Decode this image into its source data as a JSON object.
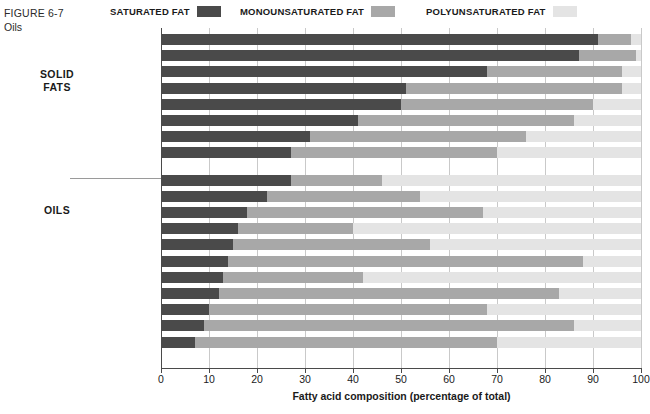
{
  "figure": {
    "number": "FIGURE 6-7",
    "title": "Oils"
  },
  "legend": {
    "position": "top",
    "items": [
      {
        "label": "SATURATED FAT",
        "key": "saturated",
        "color": "#4a4a4a"
      },
      {
        "label": "MONOUNSATURATED FAT",
        "key": "monounsaturated",
        "color": "#a8a8a8"
      },
      {
        "label": "POLYUNSATURATED FAT",
        "key": "polyunsaturated",
        "color": "#e4e4e4"
      }
    ]
  },
  "groups": [
    {
      "label": "SOLID\nFATS",
      "line1": "SOLID",
      "line2": "FATS"
    },
    {
      "label": "OILS",
      "line1": "OILS",
      "line2": ""
    }
  ],
  "axis": {
    "title": "Fatty acid composition (percentage of total)",
    "ticks": [
      0,
      10,
      20,
      30,
      40,
      50,
      60,
      70,
      80,
      90,
      100
    ],
    "min": 0,
    "max": 100
  },
  "footnotes": {
    "single_star": "*",
    "double_star": "**"
  },
  "chart_data": {
    "type": "bar",
    "orientation": "horizontal",
    "stacked": true,
    "title": "Oils",
    "subtitle": "FIGURE 6-7",
    "xlabel": "Fatty acid composition (percentage of total)",
    "ylabel": "",
    "xlim": [
      0,
      100
    ],
    "grid": true,
    "legend_position": "top",
    "series": [
      {
        "name": "SATURATED FAT",
        "color": "#4a4a4a",
        "values": [
          91,
          87,
          68,
          51,
          50,
          41,
          31,
          27,
          27,
          22,
          18,
          16,
          15,
          14,
          13,
          12,
          10,
          9,
          7
        ]
      },
      {
        "name": "MONOUNSATURATED FAT",
        "color": "#a8a8a8",
        "values": [
          7,
          12,
          28,
          45,
          40,
          45,
          45,
          43,
          19,
          32,
          49,
          24,
          41,
          74,
          29,
          71,
          58,
          77,
          63
        ]
      },
      {
        "name": "POLYUNSATURATED FAT",
        "color": "#e4e4e4",
        "values": [
          2,
          1,
          4,
          4,
          10,
          14,
          24,
          30,
          54,
          46,
          33,
          60,
          44,
          12,
          58,
          17,
          32,
          14,
          30
        ]
      }
    ],
    "categories": [
      "Coconut oil*",
      "Palm kernel oil*",
      "Butter",
      "Beef fat (tallow)",
      "Palm oil*",
      "Pork fat (lard)",
      "Chicken fat",
      "Shortening**",
      "Cottonseed oil",
      "Salmon oil",
      "Peanut oil",
      "Soybean oil",
      "Sesame oil",
      "Olive oil",
      "Corn oil",
      "Avocado oil",
      "Sunflower oil",
      "Safflower oil",
      "Canola oil"
    ],
    "rows": [
      {
        "label": "Coconut oil*",
        "group": "SOLID FATS",
        "saturated": 91,
        "monounsaturated": 7,
        "polyunsaturated": 2
      },
      {
        "label": "Palm kernel oil*",
        "group": "SOLID FATS",
        "saturated": 87,
        "monounsaturated": 12,
        "polyunsaturated": 1
      },
      {
        "label": "Butter",
        "group": "SOLID FATS",
        "saturated": 68,
        "monounsaturated": 28,
        "polyunsaturated": 4
      },
      {
        "label": "Beef fat (tallow)",
        "group": "SOLID FATS",
        "saturated": 51,
        "monounsaturated": 45,
        "polyunsaturated": 4
      },
      {
        "label": "Palm oil*",
        "group": "SOLID FATS",
        "saturated": 50,
        "monounsaturated": 40,
        "polyunsaturated": 10
      },
      {
        "label": "Pork fat (lard)",
        "group": "SOLID FATS",
        "saturated": 41,
        "monounsaturated": 45,
        "polyunsaturated": 14
      },
      {
        "label": "Chicken fat",
        "group": "SOLID FATS",
        "saturated": 31,
        "monounsaturated": 45,
        "polyunsaturated": 24
      },
      {
        "label": "Shortening**",
        "group": "SOLID FATS",
        "saturated": 27,
        "monounsaturated": 43,
        "polyunsaturated": 30
      },
      {
        "label": "Cottonseed oil",
        "group": "OILS",
        "saturated": 27,
        "monounsaturated": 19,
        "polyunsaturated": 54
      },
      {
        "label": "Salmon oil",
        "group": "OILS",
        "saturated": 22,
        "monounsaturated": 32,
        "polyunsaturated": 46
      },
      {
        "label": "Peanut oil",
        "group": "OILS",
        "saturated": 18,
        "monounsaturated": 49,
        "polyunsaturated": 33
      },
      {
        "label": "Soybean oil",
        "group": "OILS",
        "saturated": 16,
        "monounsaturated": 24,
        "polyunsaturated": 60
      },
      {
        "label": "Sesame oil",
        "group": "OILS",
        "saturated": 15,
        "monounsaturated": 41,
        "polyunsaturated": 44
      },
      {
        "label": "Olive oil",
        "group": "OILS",
        "saturated": 14,
        "monounsaturated": 74,
        "polyunsaturated": 12
      },
      {
        "label": "Corn oil",
        "group": "OILS",
        "saturated": 13,
        "monounsaturated": 29,
        "polyunsaturated": 58
      },
      {
        "label": "Avocado oil",
        "group": "OILS",
        "saturated": 12,
        "monounsaturated": 71,
        "polyunsaturated": 17
      },
      {
        "label": "Sunflower oil",
        "group": "OILS",
        "saturated": 10,
        "monounsaturated": 58,
        "polyunsaturated": 32
      },
      {
        "label": "Safflower oil",
        "group": "OILS",
        "saturated": 9,
        "monounsaturated": 77,
        "polyunsaturated": 14
      },
      {
        "label": "Canola oil",
        "group": "OILS",
        "saturated": 7,
        "monounsaturated": 63,
        "polyunsaturated": 30
      }
    ]
  }
}
